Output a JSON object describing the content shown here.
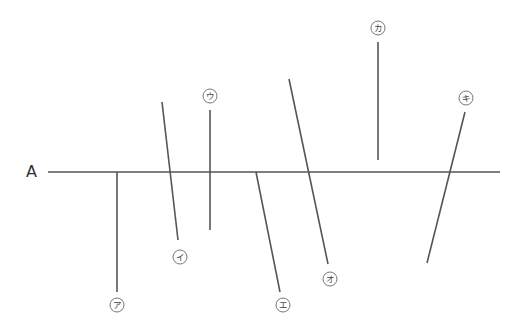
{
  "diagram": {
    "line_A": {
      "label": "A",
      "x1": 48,
      "y1": 172,
      "x2": 500,
      "y2": 172
    },
    "lines": [
      {
        "id": "a",
        "label": "ア",
        "x1": 117,
        "y1": 172,
        "x2": 117,
        "y2": 292,
        "label_x": 117,
        "label_y": 305
      },
      {
        "id": "i",
        "label": "イ",
        "x1": 162,
        "y1": 102,
        "x2": 178,
        "y2": 240,
        "label_x": 180,
        "label_y": 257
      },
      {
        "id": "u",
        "label": "ウ",
        "x1": 210,
        "y1": 110,
        "x2": 210,
        "y2": 230,
        "label_x": 210,
        "label_y": 96
      },
      {
        "id": "e",
        "label": "エ",
        "x1": 256,
        "y1": 172,
        "x2": 280,
        "y2": 292,
        "label_x": 283,
        "label_y": 305
      },
      {
        "id": "o",
        "label": "オ",
        "x1": 289,
        "y1": 79,
        "x2": 328,
        "y2": 264,
        "label_x": 330,
        "label_y": 279
      },
      {
        "id": "ka",
        "label": "カ",
        "x1": 378,
        "y1": 42,
        "x2": 378,
        "y2": 160,
        "label_x": 378,
        "label_y": 28
      },
      {
        "id": "ki",
        "label": "キ",
        "x1": 465,
        "y1": 112,
        "x2": 427,
        "y2": 263,
        "label_x": 466,
        "label_y": 98
      }
    ],
    "colors": {
      "line": "#555555",
      "label": "#444444"
    }
  }
}
